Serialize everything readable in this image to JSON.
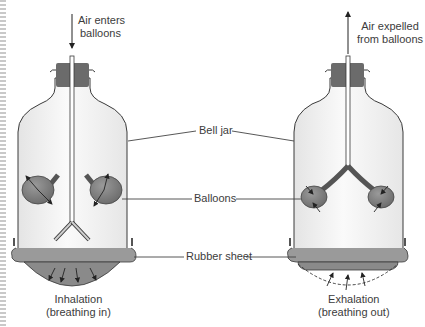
{
  "diagram": {
    "left_model": {
      "top_label_line1": "Air enters",
      "top_label_line2": "balloons",
      "caption_line1": "Inhalation",
      "caption_line2": "(breathing in)"
    },
    "right_model": {
      "top_label_line1": "Air expelled",
      "top_label_line2": "from balloons",
      "caption_line1": "Exhalation",
      "caption_line2": "(breathing out)"
    },
    "center_labels": {
      "bell_jar": "Bell jar",
      "balloons": "Balloons",
      "rubber_sheet": "Rubber sheet"
    },
    "colors": {
      "jar_fill": "#f3f3f3",
      "stopper": "#6b6b6b",
      "balloon": "#7d7d7d",
      "rubber": "#8a8a8a",
      "outline": "#3a3a3a"
    }
  }
}
